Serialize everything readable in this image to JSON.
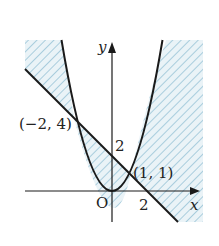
{
  "diagram": {
    "type": "coordinate-graph",
    "curves": [
      {
        "name": "parabola",
        "equation": "y = x^2"
      },
      {
        "name": "line",
        "equation": "y = -x + 2"
      }
    ],
    "labels": {
      "x_axis": "x",
      "y_axis": "y",
      "origin": "O",
      "y_intercept": "2",
      "x_intercept": "2",
      "point_left": "(−2, 4)",
      "point_right": "(1, 1)"
    },
    "intersection_points": [
      {
        "x": -2,
        "y": 4
      },
      {
        "x": 1,
        "y": 1
      }
    ],
    "shading": {
      "color": "#bcd9e6",
      "style": "diagonal-hatch",
      "regions": [
        "upper-left between line and parabola",
        "between line and parabola for -2<x<1",
        "right of parabola above line for x>1"
      ]
    },
    "colors": {
      "curve": "#1a1a1a",
      "hatch": "#9cc4d6",
      "fill": "#e6f1f6"
    }
  }
}
